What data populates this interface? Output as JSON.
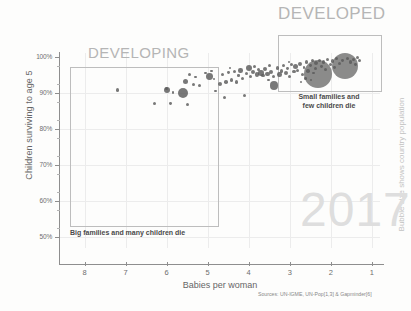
{
  "chart_data": {
    "type": "scatter",
    "title": "",
    "xlabel": "Babies per woman",
    "ylabel": "Children surviving to age 5",
    "xlim": [
      8.6,
      0.8
    ],
    "ylim": [
      0.47,
      1.01
    ],
    "x_ticks": [
      "8",
      "7",
      "6",
      "5",
      "4",
      "3",
      "2",
      "1"
    ],
    "x_tick_values": [
      8,
      7,
      6,
      5,
      4,
      3,
      2,
      1
    ],
    "y_ticks": [
      "100%",
      "90%",
      "80%",
      "70%",
      "60%",
      "50%"
    ],
    "y_tick_values": [
      1.0,
      0.9,
      0.8,
      0.7,
      0.6,
      0.5
    ],
    "grid": true,
    "legend_position": "none",
    "size_legend": "Bubble size shows country population",
    "year": "2017",
    "sources": "Sources: UN-IGME, UN-Pop[1,3] & Gapminder[6]",
    "annotations": [
      {
        "name": "developing",
        "heading": "DEVELOPING",
        "caption": "Big families and many children die",
        "x_range": [
          8.3,
          5.0
        ],
        "y_range": [
          0.55,
          0.955
        ]
      },
      {
        "name": "developed",
        "heading": "DEVELOPED",
        "caption_line1": "Small families and",
        "caption_line2": "few children die",
        "x_range": [
          2.85,
          1.25
        ],
        "y_range": [
          0.925,
          1.005
        ]
      }
    ],
    "points": [
      {
        "x": 7.2,
        "y": 0.907,
        "r": 1.8
      },
      {
        "x": 6.3,
        "y": 0.87,
        "r": 1.6
      },
      {
        "x": 6.0,
        "y": 0.908,
        "r": 3.0
      },
      {
        "x": 6.0,
        "y": 0.912,
        "r": 1.6
      },
      {
        "x": 5.9,
        "y": 0.87,
        "r": 1.4
      },
      {
        "x": 5.85,
        "y": 0.9,
        "r": 1.3
      },
      {
        "x": 5.6,
        "y": 0.9,
        "r": 5.0
      },
      {
        "x": 5.55,
        "y": 0.93,
        "r": 2.6
      },
      {
        "x": 5.5,
        "y": 0.868,
        "r": 1.5
      },
      {
        "x": 5.45,
        "y": 0.951,
        "r": 1.6
      },
      {
        "x": 5.35,
        "y": 0.923,
        "r": 1.7
      },
      {
        "x": 5.3,
        "y": 0.944,
        "r": 1.3
      },
      {
        "x": 5.2,
        "y": 0.92,
        "r": 1.5
      },
      {
        "x": 5.05,
        "y": 0.954,
        "r": 1.2
      },
      {
        "x": 4.95,
        "y": 0.945,
        "r": 3.4
      },
      {
        "x": 4.9,
        "y": 0.96,
        "r": 1.4
      },
      {
        "x": 4.85,
        "y": 0.938,
        "r": 1.3
      },
      {
        "x": 4.8,
        "y": 0.905,
        "r": 1.4
      },
      {
        "x": 4.7,
        "y": 0.925,
        "r": 2.0
      },
      {
        "x": 4.65,
        "y": 0.95,
        "r": 1.5
      },
      {
        "x": 4.6,
        "y": 0.888,
        "r": 1.5
      },
      {
        "x": 4.55,
        "y": 0.93,
        "r": 1.8
      },
      {
        "x": 4.5,
        "y": 0.956,
        "r": 1.4
      },
      {
        "x": 4.42,
        "y": 0.935,
        "r": 1.6
      },
      {
        "x": 4.35,
        "y": 0.958,
        "r": 1.5
      },
      {
        "x": 4.3,
        "y": 0.93,
        "r": 1.9
      },
      {
        "x": 4.25,
        "y": 0.948,
        "r": 1.3
      },
      {
        "x": 4.2,
        "y": 0.962,
        "r": 2.2
      },
      {
        "x": 4.15,
        "y": 0.94,
        "r": 1.5
      },
      {
        "x": 4.1,
        "y": 0.893,
        "r": 1.6
      },
      {
        "x": 4.05,
        "y": 0.952,
        "r": 1.5
      },
      {
        "x": 4.0,
        "y": 0.968,
        "r": 3.2
      },
      {
        "x": 3.95,
        "y": 0.945,
        "r": 1.5
      },
      {
        "x": 3.9,
        "y": 0.958,
        "r": 2.0
      },
      {
        "x": 3.85,
        "y": 0.972,
        "r": 1.6
      },
      {
        "x": 3.8,
        "y": 0.95,
        "r": 2.4
      },
      {
        "x": 3.75,
        "y": 0.963,
        "r": 1.5
      },
      {
        "x": 3.7,
        "y": 0.955,
        "r": 2.8
      },
      {
        "x": 3.65,
        "y": 0.948,
        "r": 1.8
      },
      {
        "x": 3.6,
        "y": 0.966,
        "r": 2.0
      },
      {
        "x": 3.55,
        "y": 0.952,
        "r": 2.4
      },
      {
        "x": 3.5,
        "y": 0.975,
        "r": 1.6
      },
      {
        "x": 3.45,
        "y": 0.958,
        "r": 2.0
      },
      {
        "x": 3.4,
        "y": 0.945,
        "r": 1.7
      },
      {
        "x": 3.38,
        "y": 0.92,
        "r": 4.2
      },
      {
        "x": 3.3,
        "y": 0.968,
        "r": 1.8
      },
      {
        "x": 3.25,
        "y": 0.95,
        "r": 2.2
      },
      {
        "x": 3.2,
        "y": 0.96,
        "r": 1.6
      },
      {
        "x": 3.15,
        "y": 0.975,
        "r": 1.5
      },
      {
        "x": 3.1,
        "y": 0.955,
        "r": 2.0
      },
      {
        "x": 3.05,
        "y": 0.967,
        "r": 1.4
      },
      {
        "x": 3.0,
        "y": 0.945,
        "r": 1.6
      },
      {
        "x": 2.95,
        "y": 0.978,
        "r": 1.5
      },
      {
        "x": 2.9,
        "y": 0.958,
        "r": 1.7
      },
      {
        "x": 2.85,
        "y": 0.972,
        "r": 2.6
      },
      {
        "x": 2.8,
        "y": 0.962,
        "r": 1.5
      },
      {
        "x": 2.75,
        "y": 0.98,
        "r": 2.2
      },
      {
        "x": 2.7,
        "y": 0.95,
        "r": 1.5
      },
      {
        "x": 2.65,
        "y": 0.97,
        "r": 1.4
      },
      {
        "x": 2.6,
        "y": 0.985,
        "r": 1.6
      },
      {
        "x": 2.55,
        "y": 0.96,
        "r": 1.8
      },
      {
        "x": 2.5,
        "y": 0.975,
        "r": 1.4
      },
      {
        "x": 2.45,
        "y": 0.988,
        "r": 1.5
      },
      {
        "x": 2.42,
        "y": 0.955,
        "r": 1.3
      },
      {
        "x": 2.38,
        "y": 0.968,
        "r": 1.6
      },
      {
        "x": 2.35,
        "y": 0.982,
        "r": 2.0
      },
      {
        "x": 2.3,
        "y": 0.952,
        "r": 14.0
      },
      {
        "x": 2.28,
        "y": 0.99,
        "r": 1.5
      },
      {
        "x": 2.22,
        "y": 0.972,
        "r": 1.4
      },
      {
        "x": 2.18,
        "y": 0.985,
        "r": 1.6
      },
      {
        "x": 2.12,
        "y": 0.965,
        "r": 1.5
      },
      {
        "x": 2.08,
        "y": 0.992,
        "r": 1.7
      },
      {
        "x": 2.0,
        "y": 0.978,
        "r": 1.5
      },
      {
        "x": 1.95,
        "y": 0.988,
        "r": 1.6
      },
      {
        "x": 1.9,
        "y": 0.97,
        "r": 1.4
      },
      {
        "x": 1.85,
        "y": 0.994,
        "r": 1.5
      },
      {
        "x": 1.78,
        "y": 0.98,
        "r": 1.6
      },
      {
        "x": 1.72,
        "y": 0.99,
        "r": 1.4
      },
      {
        "x": 1.65,
        "y": 0.975,
        "r": 13.0
      },
      {
        "x": 1.6,
        "y": 0.996,
        "r": 1.5
      },
      {
        "x": 1.52,
        "y": 0.985,
        "r": 1.6
      },
      {
        "x": 1.45,
        "y": 0.993,
        "r": 1.5
      },
      {
        "x": 1.4,
        "y": 0.978,
        "r": 1.4
      },
      {
        "x": 1.35,
        "y": 0.997,
        "r": 1.6
      },
      {
        "x": 1.3,
        "y": 0.988,
        "r": 1.5
      },
      {
        "x": 4.45,
        "y": 0.968,
        "r": 1.2
      },
      {
        "x": 3.52,
        "y": 0.935,
        "r": 1.4
      },
      {
        "x": 2.62,
        "y": 0.94,
        "r": 1.3
      },
      {
        "x": 2.48,
        "y": 0.935,
        "r": 1.2
      },
      {
        "x": 3.02,
        "y": 0.985,
        "r": 1.3
      },
      {
        "x": 2.72,
        "y": 0.93,
        "r": 1.2
      }
    ]
  },
  "axes": {
    "y_title": "Children surviving to age 5",
    "x_title": "Babies per woman"
  },
  "watermark": {
    "year": "2017"
  },
  "footer": {
    "sources": "Sources: UN-IGME, UN-Pop[1,3] & Gapminder[6]"
  },
  "side_label": {
    "text": "Bubble size shows country population"
  },
  "regions": {
    "developing": {
      "heading": "DEVELOPING",
      "caption": "Big families and many children die"
    },
    "developed": {
      "heading": "DEVELOPED",
      "caption_line1": "Small families and",
      "caption_line2": "few children die"
    }
  }
}
